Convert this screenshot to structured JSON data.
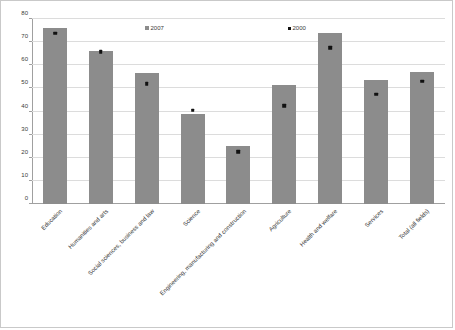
{
  "chart_data": {
    "type": "bar",
    "title": "",
    "subtitle": "",
    "xlabel": "",
    "ylabel": "",
    "ylim": [
      0,
      80
    ],
    "ytick_step": 10,
    "yticks": [
      "0",
      "10",
      "20",
      "30",
      "40",
      "50",
      "60",
      "70",
      "80"
    ],
    "grid": true,
    "legend_position": "inside-top",
    "categories": [
      "Education",
      "Humanities and arts",
      "Social sciences, business and law",
      "Science",
      "Engineering, manufacturing and construction",
      "Agriculture",
      "Health and welfare",
      "Services",
      "Total (all fields)"
    ],
    "series": [
      {
        "name": "2007",
        "render": "bar",
        "color": "#8c8c8c",
        "values": [
          76,
          66,
          56.5,
          39,
          25,
          51.5,
          74,
          53.5,
          57
        ]
      },
      {
        "name": "2000",
        "render": "marker",
        "color": "#111111",
        "values": [
          73.8,
          65.8,
          52,
          40.5,
          22.5,
          42.5,
          67.5,
          47.5,
          53
        ]
      }
    ]
  },
  "legend": {
    "items": [
      {
        "label": "2007"
      },
      {
        "label": "2000"
      }
    ]
  },
  "colors": {
    "bar": "#8c8c8c",
    "marker": "#111111",
    "gridline": "#dcdcdc",
    "axis": "#a0a0a0",
    "border": "#c9c9c9",
    "text": "#3a3a3a",
    "background": "#ffffff"
  }
}
